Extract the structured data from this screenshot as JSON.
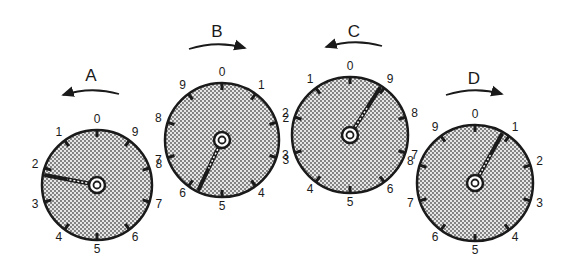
{
  "figure": {
    "colors": {
      "ink": "#1a1a1a",
      "face": "#d8d8d8",
      "dots": "#555555",
      "background": "#ffffff"
    }
  },
  "dials": [
    {
      "id": "A",
      "label": "A",
      "direction": "counterclockwise",
      "arrow": "left",
      "center": [
        97,
        185
      ],
      "radius": 55,
      "numbers_clockwise_from_top": [
        "0",
        "9",
        "8",
        "7",
        "6",
        "5",
        "4",
        "3",
        "2",
        "1"
      ],
      "pointer_value": 2.2,
      "label_pos": [
        91,
        77
      ],
      "arrow_y": 92
    },
    {
      "id": "B",
      "label": "B",
      "direction": "clockwise",
      "arrow": "right",
      "center": [
        222,
        140
      ],
      "radius": 57,
      "numbers_clockwise_from_top": [
        "0",
        "1",
        "2",
        "3",
        "4",
        "5",
        "6",
        "7",
        "8",
        "9"
      ],
      "pointer_value": 5.7,
      "label_pos": [
        217,
        33
      ],
      "arrow_y": 46
    },
    {
      "id": "C",
      "label": "C",
      "direction": "counterclockwise",
      "arrow": "left",
      "center": [
        350,
        135
      ],
      "radius": 58,
      "numbers_clockwise_from_top": [
        "0",
        "9",
        "8",
        "7",
        "6",
        "5",
        "4",
        "3",
        "2",
        "1"
      ],
      "pointer_value": 9.1,
      "label_pos": [
        354,
        33
      ],
      "arrow_y": 44
    },
    {
      "id": "D",
      "label": "D",
      "direction": "clockwise",
      "arrow": "right",
      "center": [
        475,
        183
      ],
      "radius": 58,
      "numbers_clockwise_from_top": [
        "0",
        "1",
        "2",
        "3",
        "4",
        "5",
        "6",
        "7",
        "8",
        "9"
      ],
      "pointer_value": 0.8,
      "label_pos": [
        474,
        80
      ],
      "arrow_y": 92
    }
  ]
}
